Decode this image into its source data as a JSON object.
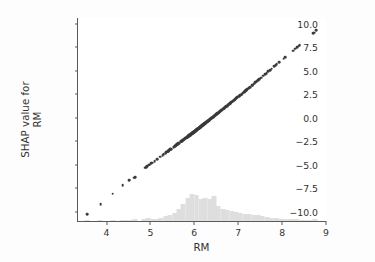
{
  "figure": {
    "background_color": "#fdfdfd",
    "plot_background_color": "#ffffff",
    "width": 375,
    "height": 262
  },
  "axes": {
    "x_label": "RM",
    "y_label": "SHAP value for\nRM",
    "x_ticks": [
      "4",
      "5",
      "6",
      "7",
      "8",
      "9"
    ],
    "y_ticks": [
      "10.0",
      "7.5",
      "5.0",
      "2.5",
      "0.0",
      "−2.5",
      "−5.0",
      "−7.5",
      "−10.0"
    ],
    "spine_color": "#5a5a5a",
    "tick_label_color": "#333333"
  },
  "style": {
    "marker_color": "#3b3b3b",
    "histogram_color": "#dededf",
    "marker_size_px": 2.7
  },
  "chart_data": {
    "type": "scatter",
    "title": "",
    "xlabel": "RM",
    "ylabel": "SHAP value for RM",
    "xlim": [
      3.35,
      9.0
    ],
    "ylim": [
      -11.0,
      10.6
    ],
    "xticks": [
      4,
      5,
      6,
      7,
      8,
      9
    ],
    "yticks": [
      10.0,
      7.5,
      5.0,
      2.5,
      0.0,
      -2.5,
      -5.0,
      -7.5,
      -10.0
    ],
    "grid": false,
    "legend": null,
    "series": [
      {
        "name": "SHAP value for RM",
        "x": [
          3.561,
          3.863,
          4.138,
          4.368,
          4.519,
          4.628,
          4.652,
          4.88,
          4.903,
          4.926,
          4.973,
          4.97,
          5.012,
          5.036,
          5.093,
          5.155,
          5.224,
          5.277,
          5.304,
          5.344,
          5.349,
          5.362,
          5.39,
          5.399,
          5.403,
          5.414,
          5.427,
          5.453,
          5.456,
          5.468,
          5.531,
          5.536,
          5.56,
          5.57,
          5.572,
          5.593,
          5.594,
          5.599,
          5.602,
          5.605,
          5.613,
          5.617,
          5.627,
          5.637,
          5.647,
          5.701,
          5.706,
          5.708,
          5.709,
          5.713,
          5.727,
          5.731,
          5.741,
          5.75,
          5.757,
          5.759,
          5.762,
          5.786,
          5.794,
          5.813,
          5.818,
          5.834,
          5.836,
          5.837,
          5.841,
          5.85,
          5.851,
          5.854,
          5.856,
          5.868,
          5.869,
          5.872,
          5.874,
          5.876,
          5.878,
          5.879,
          5.88,
          5.885,
          5.886,
          5.888,
          5.889,
          5.891,
          5.895,
          5.898,
          5.9,
          5.904,
          5.914,
          5.924,
          5.926,
          5.927,
          5.933,
          5.935,
          5.936,
          5.951,
          5.952,
          5.957,
          5.96,
          5.961,
          5.963,
          5.965,
          5.966,
          5.968,
          5.972,
          5.976,
          5.981,
          5.983,
          5.986,
          5.987,
          5.99,
          5.993,
          6.003,
          6.004,
          6.006,
          6.009,
          6.012,
          6.015,
          6.019,
          6.02,
          6.023,
          6.027,
          6.03,
          6.031,
          6.037,
          6.04,
          6.047,
          6.051,
          6.054,
          6.059,
          6.064,
          6.065,
          6.067,
          6.07,
          6.075,
          6.078,
          6.083,
          6.086,
          6.087,
          6.093,
          6.096,
          6.101,
          6.104,
          6.108,
          6.112,
          6.114,
          6.12,
          6.122,
          6.127,
          6.129,
          6.137,
          6.14,
          6.143,
          6.149,
          6.152,
          6.156,
          6.162,
          6.167,
          6.172,
          6.174,
          6.182,
          6.185,
          6.193,
          6.199,
          6.202,
          6.208,
          6.211,
          6.216,
          6.219,
          6.226,
          6.229,
          6.232,
          6.24,
          6.242,
          6.245,
          6.249,
          6.251,
          6.254,
          6.259,
          6.266,
          6.273,
          6.279,
          6.286,
          6.29,
          6.297,
          6.301,
          6.312,
          6.315,
          6.326,
          6.333,
          6.341,
          6.345,
          6.349,
          6.358,
          6.372,
          6.381,
          6.389,
          6.395,
          6.405,
          6.415,
          6.426,
          6.434,
          6.442,
          6.453,
          6.461,
          6.471,
          6.482,
          6.492,
          6.501,
          6.511,
          6.516,
          6.525,
          6.54,
          6.552,
          6.563,
          6.579,
          6.593,
          6.604,
          6.616,
          6.63,
          6.647,
          6.657,
          6.674,
          6.683,
          6.701,
          6.715,
          6.728,
          6.741,
          6.758,
          6.774,
          6.782,
          6.794,
          6.812,
          6.826,
          6.841,
          6.861,
          6.871,
          6.889,
          6.907,
          6.93,
          6.951,
          6.968,
          6.98,
          7.007,
          7.024,
          7.041,
          7.061,
          7.079,
          7.104,
          7.129,
          7.148,
          7.163,
          7.178,
          7.185,
          7.203,
          7.236,
          7.249,
          7.267,
          7.313,
          7.327,
          7.358,
          7.393,
          7.412,
          7.42,
          7.454,
          7.47,
          7.489,
          7.52,
          7.57,
          7.61,
          7.645,
          7.686,
          7.73,
          7.765,
          7.82,
          7.853,
          7.875,
          7.929,
          8.034,
          8.069,
          8.247,
          8.297,
          8.337,
          8.375,
          8.398,
          8.704,
          8.725,
          8.78
        ],
        "y": [
          -10.29,
          -9.22,
          -8.09,
          -7.2,
          -6.62,
          -6.38,
          -6.3,
          -5.32,
          -5.26,
          -5.18,
          -5.01,
          -5.02,
          -4.88,
          -4.8,
          -4.61,
          -4.4,
          -4.16,
          -3.98,
          -3.89,
          -3.75,
          -3.73,
          -3.69,
          -3.59,
          -3.56,
          -3.55,
          -3.51,
          -3.46,
          -3.38,
          -3.37,
          -3.33,
          -3.11,
          -3.09,
          -3.01,
          -2.98,
          -2.97,
          -2.9,
          -2.89,
          -2.88,
          -2.87,
          -2.86,
          -2.83,
          -2.82,
          -2.78,
          -2.75,
          -2.71,
          -2.53,
          -2.51,
          -2.51,
          -2.5,
          -2.49,
          -2.44,
          -2.43,
          -2.39,
          -2.36,
          -2.34,
          -2.33,
          -2.32,
          -2.24,
          -2.21,
          -2.14,
          -2.13,
          -2.07,
          -2.07,
          -2.06,
          -2.05,
          -2.02,
          -2.01,
          -2.0,
          -2.0,
          -1.95,
          -1.95,
          -1.94,
          -1.93,
          -1.93,
          -1.92,
          -1.92,
          -1.91,
          -1.89,
          -1.89,
          -1.88,
          -1.88,
          -1.87,
          -1.86,
          -1.85,
          -1.84,
          -1.83,
          -1.79,
          -1.76,
          -1.75,
          -1.75,
          -1.73,
          -1.72,
          -1.72,
          -1.66,
          -1.66,
          -1.65,
          -1.63,
          -1.63,
          -1.62,
          -1.62,
          -1.61,
          -1.61,
          -1.59,
          -1.58,
          -1.56,
          -1.55,
          -1.54,
          -1.54,
          -1.53,
          -1.52,
          -1.48,
          -1.48,
          -1.47,
          -1.46,
          -1.45,
          -1.44,
          -1.42,
          -1.42,
          -1.41,
          -1.39,
          -1.38,
          -1.38,
          -1.36,
          -1.35,
          -1.32,
          -1.31,
          -1.3,
          -1.28,
          -1.26,
          -1.26,
          -1.25,
          -1.24,
          -1.22,
          -1.21,
          -1.19,
          -1.18,
          -1.18,
          -1.16,
          -1.15,
          -1.13,
          -1.12,
          -1.1,
          -1.09,
          -1.08,
          -1.06,
          -1.05,
          -1.03,
          -1.03,
          -1.0,
          -0.99,
          -0.98,
          -0.95,
          -0.94,
          -0.93,
          -0.91,
          -0.89,
          -0.87,
          -0.86,
          -0.83,
          -0.82,
          -0.79,
          -0.77,
          -0.76,
          -0.73,
          -0.72,
          -0.7,
          -0.69,
          -0.67,
          -0.65,
          -0.64,
          -0.61,
          -0.61,
          -0.59,
          -0.58,
          -0.57,
          -0.56,
          -0.54,
          -0.52,
          -0.49,
          -0.47,
          -0.44,
          -0.43,
          -0.4,
          -0.39,
          -0.35,
          -0.33,
          -0.29,
          -0.27,
          -0.24,
          -0.22,
          -0.21,
          -0.17,
          -0.12,
          -0.09,
          -0.06,
          -0.03,
          0.0,
          0.04,
          0.08,
          0.11,
          0.14,
          0.18,
          0.21,
          0.25,
          0.29,
          0.32,
          0.36,
          0.39,
          0.41,
          0.45,
          0.5,
          0.55,
          0.59,
          0.65,
          0.7,
          0.74,
          0.79,
          0.84,
          0.9,
          0.94,
          1.0,
          1.04,
          1.1,
          1.16,
          1.2,
          1.25,
          1.32,
          1.38,
          1.41,
          1.45,
          1.52,
          1.57,
          1.63,
          1.7,
          1.74,
          1.81,
          1.88,
          1.96,
          2.04,
          2.11,
          2.15,
          2.26,
          2.32,
          2.39,
          2.46,
          2.53,
          2.63,
          2.72,
          2.8,
          2.85,
          2.91,
          2.94,
          3.01,
          3.14,
          3.19,
          3.26,
          3.44,
          3.49,
          3.61,
          3.75,
          3.82,
          3.86,
          3.99,
          4.06,
          4.13,
          4.25,
          4.45,
          4.61,
          4.74,
          4.91,
          5.08,
          5.22,
          5.44,
          5.57,
          5.66,
          5.88,
          6.29,
          6.43,
          7.14,
          7.34,
          7.5,
          7.65,
          7.74,
          8.97,
          9.05,
          9.27
        ]
      }
    ],
    "histogram": {
      "name": "RM distribution",
      "orientation": "vertical",
      "anchored_at_bottom": true,
      "bin_centers": [
        3.55,
        3.65,
        3.75,
        3.85,
        3.95,
        4.05,
        4.15,
        4.25,
        4.35,
        4.45,
        4.55,
        4.65,
        4.75,
        4.85,
        4.95,
        5.05,
        5.15,
        5.25,
        5.35,
        5.45,
        5.55,
        5.65,
        5.75,
        5.85,
        5.95,
        6.05,
        6.15,
        6.25,
        6.35,
        6.45,
        6.55,
        6.65,
        6.75,
        6.85,
        6.95,
        7.05,
        7.15,
        7.25,
        7.35,
        7.45,
        7.55,
        7.65,
        7.75,
        7.85,
        7.95,
        8.05,
        8.15,
        8.25,
        8.35,
        8.45,
        8.55,
        8.65,
        8.75
      ],
      "counts": [
        1,
        0,
        0,
        1,
        0,
        0,
        1,
        0,
        1,
        1,
        1,
        2,
        0,
        3,
        4,
        3,
        3,
        4,
        6,
        7,
        10,
        14,
        20,
        28,
        33,
        31,
        27,
        28,
        26,
        30,
        18,
        15,
        13,
        12,
        11,
        10,
        9,
        8,
        7,
        7,
        6,
        5,
        4,
        4,
        3,
        3,
        2,
        2,
        2,
        1,
        1,
        1,
        2
      ],
      "max_count": 33
    }
  }
}
